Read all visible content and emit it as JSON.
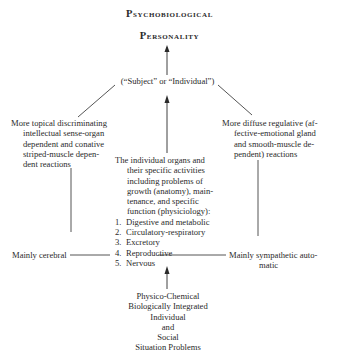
{
  "title": {
    "line1": "Psychobiological",
    "line2": "Personality"
  },
  "subject_node": "(“Subject” or “Individual”)",
  "left_branch": {
    "lines": [
      "More topical discriminating",
      "intellectual sense-organ",
      "dependent and conative",
      "striped-muscle depen-",
      "dent reactions"
    ],
    "bottom_label": "Mainly cerebral"
  },
  "right_branch": {
    "lines": [
      "More diffuse regulative (af-",
      "fective-emotional gland",
      "and smooth-muscle de-",
      "pendent) reactions"
    ],
    "bottom_label_line1": "Mainly sympathetic auto-",
    "bottom_label_line2": "matic"
  },
  "center_node": {
    "intro_lines": [
      "The individual organs and",
      "their specific activities",
      "including problems of",
      "growth (anatomy), main-",
      "tenance, and specific",
      "function (physiciology):"
    ],
    "items": [
      {
        "num": "1.",
        "label": "Digestive and metabolic"
      },
      {
        "num": "2.",
        "label": "Circulatory-respiratory"
      },
      {
        "num": "3.",
        "label": "Excretory"
      },
      {
        "num": "4.",
        "label": "Reproductive"
      },
      {
        "num": "5.",
        "label": "Nervous"
      }
    ]
  },
  "bottom_node": {
    "lines": [
      "Physico-Chemical",
      "Biologically Integrated",
      "Individual",
      "and",
      "Social",
      "Situation Problems"
    ]
  }
}
